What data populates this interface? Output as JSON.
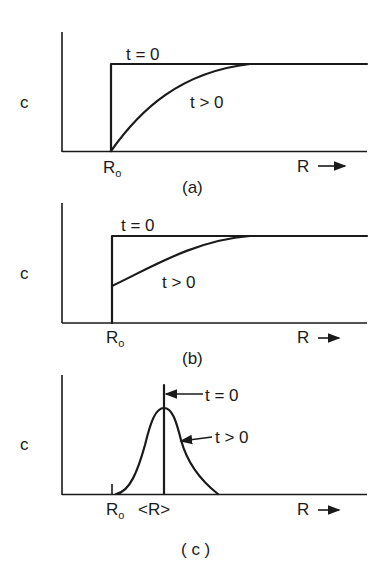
{
  "figure": {
    "panels": [
      {
        "id": "a",
        "caption": "(a)",
        "ylabel": "c",
        "xlabel": "R",
        "x_arrow": "→",
        "ro_label": "R",
        "ro_sub": "o",
        "label_t0": "t = 0",
        "label_tpos": "t > 0"
      },
      {
        "id": "b",
        "caption": "(b)",
        "ylabel": "c",
        "xlabel": "R",
        "x_arrow": "→",
        "ro_label": "R",
        "ro_sub": "o",
        "label_t0": "t = 0",
        "label_tpos": "t > 0"
      },
      {
        "id": "c",
        "caption": "( c )",
        "ylabel": "c",
        "xlabel": "R",
        "x_arrow": "→",
        "ro_label": "R",
        "ro_sub": "o",
        "mean_label": "<R>",
        "label_t0": "t = 0",
        "label_tpos": "t > 0"
      }
    ]
  },
  "colors": {
    "ink": "#1a1a1a",
    "background": "#ffffff"
  }
}
